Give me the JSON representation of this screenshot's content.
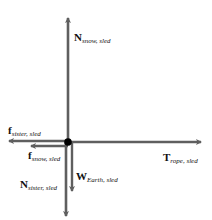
{
  "diagram": {
    "colors": {
      "arrow": "#5f5f5f",
      "dot": "#000000",
      "text": "#111111",
      "background": "#ffffff"
    },
    "object": {
      "name": "sled",
      "shape": "dot"
    },
    "forces": [
      {
        "id": "n_snow_sled",
        "symbol": "N",
        "subscript": "snow, sled",
        "direction": "up"
      },
      {
        "id": "f_sister_sled",
        "symbol": "f",
        "subscript": "sister, sled",
        "direction": "left"
      },
      {
        "id": "f_snow_sled",
        "symbol": "f",
        "subscript": "snow, sled",
        "direction": "left"
      },
      {
        "id": "t_rope_sled",
        "symbol": "T",
        "subscript": "rope, sled",
        "direction": "right"
      },
      {
        "id": "w_earth_sled",
        "symbol": "W",
        "subscript": "Earth, sled",
        "direction": "down"
      },
      {
        "id": "n_sister_sled",
        "symbol": "N",
        "subscript": "sister, sled",
        "direction": "down"
      }
    ]
  }
}
